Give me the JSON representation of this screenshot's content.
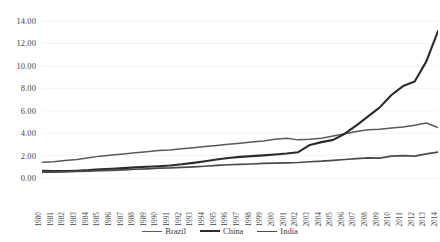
{
  "chart_data": {
    "type": "line",
    "title": "",
    "xlabel": "",
    "ylabel": "",
    "grid": true,
    "legend_position": "bottom",
    "ylim": [
      0,
      14
    ],
    "ytick_labels": [
      "14.00",
      "12.00",
      "10.00",
      "8.00",
      "6.00",
      "4.00",
      "2.00",
      "0.00"
    ],
    "ytick_values": [
      14,
      12,
      10,
      8,
      6,
      4,
      2,
      0
    ],
    "categories": [
      "1980",
      "1981",
      "1982",
      "1983",
      "1984",
      "1985",
      "1986",
      "1987",
      "1988",
      "1989",
      "1990",
      "1991",
      "1992",
      "1993",
      "1994",
      "1995",
      "1996",
      "1997",
      "1998",
      "1999",
      "2000",
      "2001",
      "2002",
      "2003",
      "2004",
      "2005",
      "2006",
      "2007",
      "2008",
      "2009",
      "2010",
      "2011",
      "2012",
      "2013",
      "2014"
    ],
    "series": [
      {
        "name": "Brazil",
        "color": "#595959",
        "width": 1.5,
        "values": [
          1.4,
          1.45,
          1.55,
          1.65,
          1.8,
          1.95,
          2.05,
          2.15,
          2.25,
          2.35,
          2.45,
          2.5,
          2.6,
          2.7,
          2.8,
          2.9,
          3.0,
          3.1,
          3.2,
          3.3,
          3.45,
          3.55,
          3.4,
          3.45,
          3.55,
          3.75,
          3.95,
          4.15,
          4.3,
          4.35,
          4.45,
          4.55,
          4.7,
          4.9,
          4.5
        ]
      },
      {
        "name": "China",
        "color": "#2b2b2b",
        "width": 2.1,
        "values": [
          0.65,
          0.62,
          0.62,
          0.65,
          0.7,
          0.78,
          0.82,
          0.88,
          0.95,
          1.0,
          1.05,
          1.12,
          1.22,
          1.35,
          1.5,
          1.65,
          1.78,
          1.88,
          1.95,
          2.02,
          2.1,
          2.18,
          2.3,
          2.95,
          3.2,
          3.4,
          3.95,
          4.7,
          5.5,
          6.3,
          7.4,
          8.2,
          8.6,
          10.4,
          13.1
        ]
      },
      {
        "name": "India",
        "color": "#4a4a4a",
        "width": 1.7,
        "values": [
          0.52,
          0.52,
          0.55,
          0.58,
          0.62,
          0.65,
          0.68,
          0.72,
          0.78,
          0.82,
          0.88,
          0.9,
          0.95,
          1.0,
          1.05,
          1.12,
          1.18,
          1.22,
          1.25,
          1.3,
          1.32,
          1.35,
          1.38,
          1.45,
          1.5,
          1.58,
          1.65,
          1.72,
          1.8,
          1.78,
          1.95,
          2.0,
          1.95,
          2.15,
          2.3
        ]
      }
    ]
  },
  "legend": [
    {
      "label": "Brazil",
      "color": "#595959",
      "width": 1.6
    },
    {
      "label": "China",
      "color": "#2b2b2b",
      "width": 2.4
    },
    {
      "label": "India",
      "color": "#4a4a4a",
      "width": 1.9
    }
  ],
  "colors": {
    "background": "#ffffff",
    "gridline": "#e8e8e8",
    "text": "#3a3a3a"
  }
}
